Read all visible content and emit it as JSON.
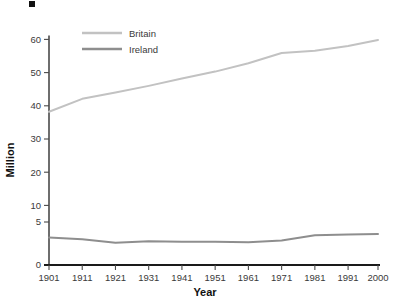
{
  "chart_data": {
    "type": "line",
    "title": "",
    "xlabel": "Year",
    "ylabel": "Million",
    "x": [
      1901,
      1911,
      1921,
      1931,
      1941,
      1951,
      1961,
      1971,
      1981,
      1991,
      2000
    ],
    "xtick_labels": [
      "1901",
      "1911",
      "1921",
      "1931",
      "1941",
      "1951",
      "1961",
      "1971",
      "1981",
      "1991",
      "2000"
    ],
    "ytick_labels": [
      "0",
      "5",
      "10",
      "20",
      "30",
      "40",
      "50",
      "60"
    ],
    "ytick_values": [
      0,
      5,
      10,
      20,
      30,
      40,
      50,
      60
    ],
    "ylim": [
      0,
      60
    ],
    "xlim": [
      1901,
      2000
    ],
    "y_axis_note": "non-linear: 0-5 expanded, then 10 units per equal step",
    "grid": false,
    "legend_position": "upper-left-inside",
    "series": [
      {
        "name": "Britain",
        "color": "#c2c2c2",
        "values": [
          38.2,
          42.1,
          44.0,
          46.0,
          48.2,
          50.3,
          52.8,
          55.9,
          56.6,
          58.0,
          59.8
        ]
      },
      {
        "name": "Ireland",
        "color": "#8e8e8e",
        "values": [
          3.2,
          3.0,
          2.6,
          2.75,
          2.7,
          2.7,
          2.65,
          2.85,
          3.45,
          3.55,
          3.6
        ]
      }
    ],
    "axis_color": "#4a4a4a",
    "baseline_color": "#1a1a1a",
    "text_color": "#3a3a3a"
  },
  "legend": {
    "items": [
      {
        "label": "Britain"
      },
      {
        "label": "Ireland"
      }
    ]
  },
  "decoration": {
    "corner_mark": "black-square-mark"
  }
}
